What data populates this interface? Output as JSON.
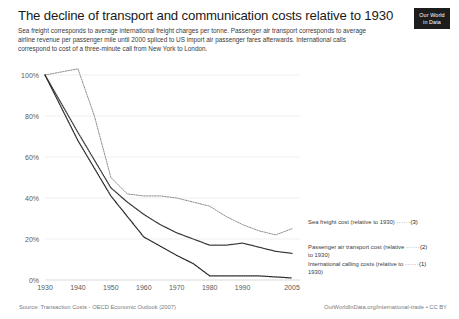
{
  "header": {
    "title": "The decline of transport and communication costs relative to 1930",
    "subtitle": "Sea freight corresponds to average international freight charges per tonne. Passenger air transport corresponds to average airline revenue per passenger mile until 2000 spliced to US import air passenger fares afterwards. International calls correspond to cost of a three-minute call from New York to London."
  },
  "logo": {
    "line1": "Our World",
    "line2": "in Data"
  },
  "footer": {
    "source": "Source: Transaction Costs - OECD Economic Outlook (2007)",
    "attribution": "OurWorldInData.org/international-trade • CC BY"
  },
  "legend": [
    {
      "id": "sea",
      "label": "Sea freight cost (relative to 1930)",
      "label_line2": "",
      "marker": "(3)",
      "dots": "······",
      "color": "#8e8e8e"
    },
    {
      "id": "air",
      "label": "Passenger air transport cost (relative",
      "label_line2": "to 1930)",
      "marker": "(2)",
      "dots": "······",
      "color": "#3a3a3a"
    },
    {
      "id": "call",
      "label": "International calling costs (relative to",
      "label_line2": "1930)",
      "marker": "(1)",
      "dots": "······",
      "color": "#2a2a2a"
    }
  ],
  "chart_data": {
    "type": "line",
    "title": "The decline of transport and communication costs relative to 1930",
    "xlabel": "",
    "ylabel": "",
    "xlim": [
      1930,
      2005
    ],
    "ylim": [
      0,
      100
    ],
    "grid": true,
    "legend_position": "right",
    "x_ticks": [
      1930,
      1940,
      1950,
      1960,
      1970,
      1980,
      1990,
      2005
    ],
    "y_ticks": [
      0,
      20,
      40,
      60,
      80,
      100
    ],
    "y_tick_labels": [
      "0%",
      "20%",
      "40%",
      "60%",
      "80%",
      "100%"
    ],
    "series": [
      {
        "name": "Sea freight cost (relative to 1930)",
        "marker": "(3)",
        "x": [
          1930,
          1940,
          1945,
          1950,
          1955,
          1960,
          1965,
          1970,
          1975,
          1980,
          1985,
          1990,
          1995,
          2000,
          2005
        ],
        "values": [
          100,
          103,
          80,
          50,
          42,
          41,
          41,
          40,
          38,
          36,
          31,
          27,
          24,
          22,
          25
        ]
      },
      {
        "name": "Passenger air transport cost (relative to 1930)",
        "marker": "(2)",
        "x": [
          1930,
          1940,
          1950,
          1955,
          1960,
          1965,
          1970,
          1975,
          1980,
          1985,
          1990,
          1995,
          2000,
          2005
        ],
        "values": [
          100,
          72,
          45,
          38,
          32,
          27,
          23,
          20,
          17,
          17,
          18,
          16,
          14,
          13
        ]
      },
      {
        "name": "International calling costs (relative to 1930)",
        "marker": "(1)",
        "x": [
          1930,
          1940,
          1950,
          1960,
          1970,
          1975,
          1980,
          1985,
          1990,
          1995,
          2000,
          2005
        ],
        "values": [
          100,
          68,
          41,
          21,
          12,
          8,
          2,
          2,
          2,
          2,
          1.5,
          1
        ]
      }
    ]
  }
}
